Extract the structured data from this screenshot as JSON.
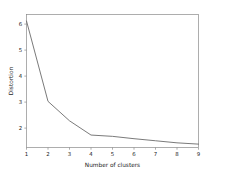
{
  "chart_data": {
    "type": "line",
    "title": "",
    "xlabel": "Number of clusters",
    "ylabel": "Distortion",
    "x": [
      1,
      2,
      3,
      4,
      5,
      6,
      7,
      8,
      9
    ],
    "values": [
      6.3,
      3.2,
      2.45,
      1.9,
      1.85,
      1.76,
      1.68,
      1.6,
      1.55
    ],
    "series": [
      {
        "name": "Distortion",
        "values": [
          6.3,
          3.2,
          2.45,
          1.9,
          1.85,
          1.76,
          1.68,
          1.6,
          1.55
        ]
      }
    ],
    "xticks": [
      "1",
      "2",
      "3",
      "4",
      "5",
      "6",
      "7",
      "8",
      "9"
    ],
    "yticks": [
      "2",
      "3",
      "4",
      "5",
      "6"
    ],
    "ytick_values": [
      2,
      3,
      4,
      5,
      6
    ],
    "xlim": [
      1,
      9
    ],
    "ylim": [
      1.42,
      6.55
    ],
    "grid": false,
    "legend": false,
    "line_color": "#6b6b6b",
    "axis_color": "#8a8a8a",
    "background_color": "#ffffff",
    "markers": false
  }
}
